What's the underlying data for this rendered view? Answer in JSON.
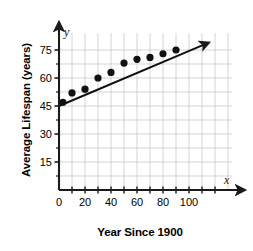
{
  "chart_data": {
    "type": "scatter",
    "title": "",
    "xlabel": "Year Since 1900",
    "ylabel": "Average Lifespan (years)",
    "x_axis_symbol": "x",
    "y_axis_symbol": "y",
    "xlim": [
      0,
      115
    ],
    "ylim": [
      0,
      82
    ],
    "xticks": [
      0,
      20,
      40,
      60,
      80,
      100
    ],
    "xtick_labels": [
      "0",
      "20",
      "40",
      "60",
      "80",
      "100"
    ],
    "x_minor_step": 10,
    "yticks": [
      15,
      30,
      45,
      60,
      75
    ],
    "ytick_labels": [
      "15",
      "30",
      "45",
      "60",
      "75"
    ],
    "y_minor_step": 7.5,
    "grid": true,
    "grid_color": "#c9c9c9",
    "axis_color": "#1a1a1a",
    "point_color": "#111111",
    "line_color": "#111111",
    "legend": "none",
    "points": [
      {
        "x": 3,
        "y": 47
      },
      {
        "x": 10,
        "y": 52
      },
      {
        "x": 20,
        "y": 54
      },
      {
        "x": 30,
        "y": 60
      },
      {
        "x": 40,
        "y": 63
      },
      {
        "x": 50,
        "y": 68
      },
      {
        "x": 60,
        "y": 70
      },
      {
        "x": 70,
        "y": 71
      },
      {
        "x": 80,
        "y": 73
      },
      {
        "x": 90,
        "y": 75
      }
    ],
    "trend_line": {
      "x_start": 0,
      "y_start": 45,
      "x_end": 112,
      "y_end": 78,
      "arrow": true
    }
  }
}
